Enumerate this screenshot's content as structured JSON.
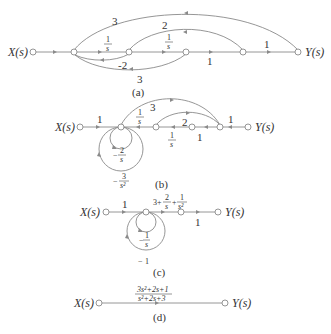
{
  "diagram": {
    "type": "signal-flow-graph-reduction",
    "panels": [
      {
        "id": "a",
        "caption": "(a)",
        "input_label": "X(s)",
        "output_label": "Y(s)",
        "gains": {
          "top_outer": "3",
          "top_inner": "2",
          "n1_n2_num": "1",
          "n1_n2_den": "s",
          "n2_n3_num": "1",
          "n2_n3_den": "s",
          "n3_n4": "1",
          "n4_out": "1",
          "feedback_inner": "-2",
          "feedback_outer": "3"
        }
      },
      {
        "id": "b",
        "caption": "(b)",
        "input_label": "X(s)",
        "output_label": "Y(s)",
        "gains": {
          "in_n1": "1",
          "top_outer": "3",
          "top_inner": "2",
          "n1_n2_num": "1",
          "n1_n2_den": "s",
          "n2_n3_num": "1",
          "n2_n3_den": "s",
          "n3_n4": "1",
          "n4_out": "1",
          "selfloop_inner_sign": "−",
          "selfloop_inner_num": "2",
          "selfloop_inner_den": "s",
          "selfloop_outer_sign": "−",
          "selfloop_outer_num": "3",
          "selfloop_outer_den": "s²"
        }
      },
      {
        "id": "c",
        "caption": "(c)",
        "input_label": "X(s)",
        "output_label": "Y(s)",
        "gains": {
          "in_n1": "1",
          "forward_a": "3+",
          "forward_b_num": "2",
          "forward_b_den": "s",
          "forward_plus": "+",
          "forward_c_num": "1",
          "forward_c_den": "s²",
          "n2_out": "1",
          "selfloop_inner_sign": "−",
          "selfloop_inner_num": "1",
          "selfloop_inner_den": "s",
          "selfloop_outer_sign": "−",
          "selfloop_outer_num": "1"
        }
      },
      {
        "id": "d",
        "caption": "(d)",
        "input_label": "X(s)",
        "output_label": "Y(s)",
        "gains": {
          "tf_num": "3s²+2s+1",
          "tf_den": "s²+2s+3"
        }
      }
    ]
  }
}
